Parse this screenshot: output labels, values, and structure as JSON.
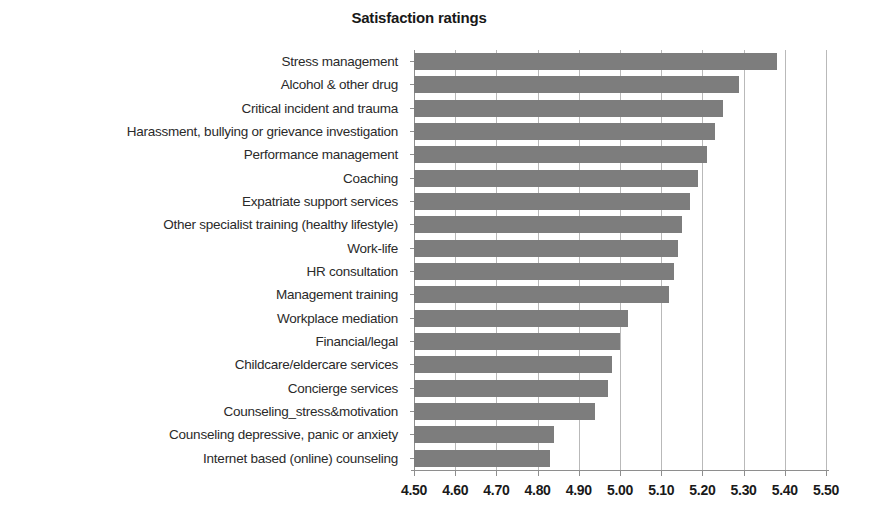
{
  "chart_data": {
    "type": "bar",
    "orientation": "horizontal",
    "title": "Satisfaction ratings",
    "xlabel": "",
    "ylabel": "",
    "xlim": [
      4.5,
      5.5
    ],
    "xticks": [
      "4.50",
      "4.60",
      "4.70",
      "4.80",
      "4.90",
      "5.00",
      "5.10",
      "5.20",
      "5.30",
      "5.40",
      "5.50"
    ],
    "xtick_values": [
      4.5,
      4.6,
      4.7,
      4.8,
      4.9,
      5.0,
      5.1,
      5.2,
      5.3,
      5.4,
      5.5
    ],
    "grid": "vertical",
    "legend": "none",
    "bar_color": "#7d7d7d",
    "categories": [
      "Stress management",
      "Alcohol & other drug",
      "Critical incident and trauma",
      "Harassment, bullying or grievance investigation",
      "Performance management",
      "Coaching",
      "Expatriate support services",
      "Other specialist training (healthy lifestyle)",
      "Work-life",
      "HR consultation",
      "Management training",
      "Workplace mediation",
      "Financial/legal",
      "Childcare/eldercare services",
      "Concierge services",
      "Counseling_stress&motivation",
      "Counseling depressive, panic or anxiety",
      "Internet based (online) counseling"
    ],
    "values": [
      5.38,
      5.29,
      5.25,
      5.23,
      5.21,
      5.19,
      5.17,
      5.15,
      5.14,
      5.13,
      5.12,
      5.02,
      5.0,
      4.98,
      4.97,
      4.94,
      4.84,
      4.83
    ]
  }
}
